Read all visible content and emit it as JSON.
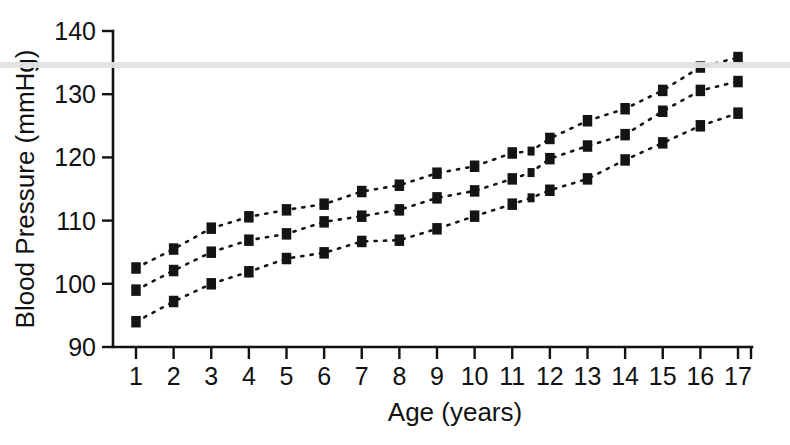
{
  "figure": {
    "background_color": "#ffffff",
    "ink_color": "#141414",
    "scanline_color": "#e2e2e2"
  },
  "chart_data": {
    "type": "line",
    "title": "",
    "subtitle": "",
    "xlabel": "Age (years)",
    "ylabel": "Blood Pressure (mmHg)",
    "xlim": [
      0.5,
      17.5
    ],
    "ylim": [
      90,
      140
    ],
    "yticks": [
      90,
      100,
      110,
      120,
      130,
      140
    ],
    "ytick_labels": [
      "90",
      "100",
      "110",
      "120",
      "130",
      "140"
    ],
    "xticks": [
      1,
      2,
      3,
      4,
      5,
      6,
      7,
      8,
      9,
      10,
      11,
      12,
      13,
      14,
      15,
      16,
      17
    ],
    "xtick_labels": [
      "1",
      "2",
      "3",
      "4",
      "5",
      "6",
      "7",
      "8",
      "9",
      "10",
      "11",
      "12",
      "13",
      "14",
      "15",
      "16",
      "17"
    ],
    "grid": false,
    "legend": false,
    "legend_position": "none",
    "marker": "square",
    "linestyle": "dotted",
    "annotations": [],
    "series": [
      {
        "name": "upper-curve",
        "x": [
          1,
          2,
          3,
          4,
          5,
          6,
          7,
          8,
          9,
          10,
          11,
          11.5,
          12,
          13,
          14,
          15,
          16,
          17
        ],
        "values": [
          102.5,
          105.5,
          108.8,
          110.6,
          111.7,
          112.6,
          114.6,
          115.6,
          117.5,
          118.6,
          120.7,
          121.0,
          123.0,
          125.8,
          127.7,
          130.6,
          134.3,
          135.8
        ]
      },
      {
        "name": "middle-curve",
        "x": [
          1,
          2,
          3,
          4,
          5,
          6,
          7,
          8,
          9,
          10,
          11,
          11.5,
          12,
          13,
          14,
          15,
          16,
          17
        ],
        "values": [
          99.0,
          102.1,
          105.0,
          106.9,
          107.9,
          109.8,
          110.7,
          111.7,
          113.6,
          114.7,
          116.6,
          117.6,
          119.8,
          121.8,
          123.6,
          127.3,
          130.6,
          132.0
        ]
      },
      {
        "name": "lower-curve",
        "x": [
          1,
          2,
          3,
          4,
          5,
          6,
          7,
          8,
          9,
          10,
          11,
          11.5,
          12,
          13,
          14,
          15,
          16,
          17
        ],
        "values": [
          94.0,
          97.2,
          100.0,
          101.9,
          104.0,
          104.9,
          106.7,
          106.9,
          108.7,
          110.7,
          112.6,
          113.6,
          114.8,
          116.6,
          119.6,
          122.3,
          125.0,
          127.0
        ]
      }
    ]
  }
}
